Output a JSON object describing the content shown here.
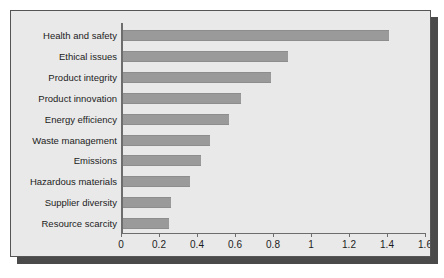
{
  "chart_data": {
    "type": "bar",
    "orientation": "horizontal",
    "title": "",
    "subtitle": "",
    "xlabel": "",
    "ylabel": "",
    "xlim": [
      0,
      1.6
    ],
    "grid": false,
    "legend": false,
    "legend_position": "none",
    "bar_color": "#9a9a9a",
    "panel_color": "#e9e9e9",
    "axis_color": "#6d6d6d",
    "text_color": "#1c1c1c",
    "x_ticks": [
      {
        "value": 0,
        "label": "0"
      },
      {
        "value": 0.2,
        "label": "0.2"
      },
      {
        "value": 0.4,
        "label": "0.4"
      },
      {
        "value": 0.6,
        "label": "0.6"
      },
      {
        "value": 0.8,
        "label": "0.8"
      },
      {
        "value": 1.0,
        "label": "1"
      },
      {
        "value": 1.2,
        "label": "1.2"
      },
      {
        "value": 1.4,
        "label": "1.4"
      },
      {
        "value": 1.6,
        "label": "1.6"
      }
    ],
    "categories": [
      "Health and safety",
      "Ethical issues",
      "Product integrity",
      "Product innovation",
      "Energy efficiency",
      "Waste management",
      "Emissions",
      "Hazardous materials",
      "Supplier diversity",
      "Resource scarcity"
    ],
    "values": [
      1.4,
      0.87,
      0.78,
      0.62,
      0.56,
      0.46,
      0.41,
      0.35,
      0.25,
      0.24
    ]
  }
}
